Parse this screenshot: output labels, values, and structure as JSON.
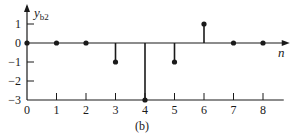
{
  "chart_data": {
    "type": "stem",
    "title": "",
    "caption": "(b)",
    "xlabel": "n",
    "ylabel": "y",
    "ylabel_subscript": "b2",
    "x": [
      0,
      1,
      2,
      3,
      4,
      5,
      6,
      7,
      8
    ],
    "values": [
      0,
      0,
      0,
      -1,
      -3,
      -1,
      1,
      0,
      0
    ],
    "xticks": [
      "0",
      "1",
      "2",
      "3",
      "4",
      "5",
      "6",
      "7",
      "8"
    ],
    "yticks": [
      "1",
      "0",
      "−1",
      "−2",
      "−3"
    ],
    "ytick_values": [
      1,
      0,
      -1,
      -2,
      -3
    ],
    "xlim": [
      0,
      8.5
    ],
    "ylim": [
      -3,
      1.6
    ],
    "grid": false,
    "legend": null,
    "colors": {
      "stem": "#1a1a1a",
      "axis": "#1a1a1a"
    }
  }
}
